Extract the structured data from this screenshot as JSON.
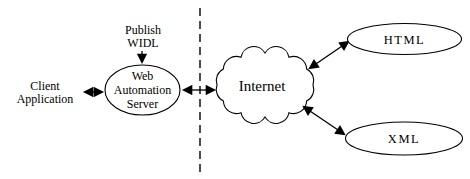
{
  "diagram": {
    "colors": {
      "background": "#ffffff",
      "line": "#000000",
      "text": "#000000"
    },
    "nodes": {
      "publish_widl": {
        "type": "label",
        "lines": [
          "Publish",
          "WIDL"
        ]
      },
      "client_application": {
        "type": "label",
        "lines": [
          "Client",
          "Application"
        ]
      },
      "web_automation_server": {
        "type": "ellipse",
        "lines": [
          "Web",
          "Automation",
          "Server"
        ]
      },
      "internet": {
        "type": "cloud",
        "label": "Internet"
      },
      "html": {
        "type": "ellipse",
        "label": "HTML"
      },
      "xml": {
        "type": "ellipse",
        "label": "XML"
      }
    },
    "edges": [
      {
        "from": "publish_widl",
        "to": "web_automation_server",
        "direction": "one-way"
      },
      {
        "from": "client_application",
        "to": "web_automation_server",
        "direction": "two-way"
      },
      {
        "from": "web_automation_server",
        "to": "internet",
        "direction": "two-way"
      },
      {
        "from": "internet",
        "to": "html",
        "direction": "two-way"
      },
      {
        "from": "internet",
        "to": "xml",
        "direction": "two-way"
      }
    ],
    "divider": {
      "type": "dashed-vertical-line"
    }
  }
}
